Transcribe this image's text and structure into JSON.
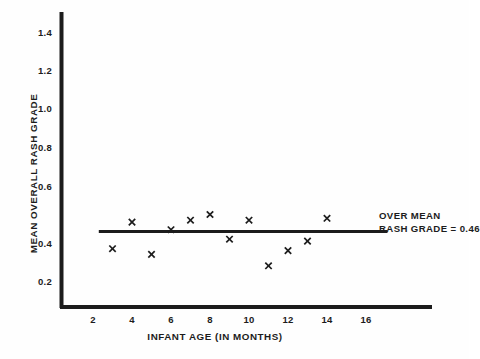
{
  "chart_data": {
    "type": "scatter",
    "title": "",
    "xlabel": "INFANT AGE (IN MONTHS)",
    "ylabel": "MEAN OVERALL RASH GRADE",
    "xlim": [
      0,
      18
    ],
    "ylim": [
      0,
      1.5
    ],
    "xticks": [
      2,
      4,
      6,
      8,
      10,
      12,
      14,
      16
    ],
    "xtick_labels": [
      "2",
      "4",
      "6",
      "8",
      "10",
      "12",
      "14",
      "16"
    ],
    "yticks": [
      0.2,
      0.4,
      0.6,
      0.8,
      1.0,
      1.2,
      1.4
    ],
    "ytick_labels": [
      "0.2",
      "0.4",
      "0.6",
      "0.8",
      "1.0",
      "1.2",
      "1.4"
    ],
    "grid": false,
    "legend": "none",
    "marker": "x",
    "marker_color": "#1c1c1c",
    "series": [
      {
        "name": "Mean overall rash grade by infant age",
        "x": [
          3,
          4,
          5,
          6,
          7,
          8,
          9,
          10,
          11,
          12,
          13,
          14
        ],
        "values": [
          0.37,
          0.51,
          0.34,
          0.47,
          0.52,
          0.55,
          0.42,
          0.52,
          0.28,
          0.36,
          0.41,
          0.53
        ]
      }
    ],
    "reference_line": {
      "orientation": "horizontal",
      "y": 0.46,
      "x_start": 2.3,
      "x_end": 17.1,
      "color": "#1c1c1c",
      "label_line1": "OVER MEAN",
      "label_line2": "RASH GRADE = 0.46"
    },
    "annotation_text": "OVER MEAN RASH GRADE = 0.46",
    "axis_color": "#1c1c1c",
    "background_color": "#fefefe"
  }
}
